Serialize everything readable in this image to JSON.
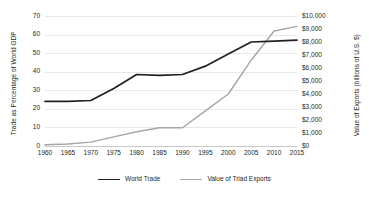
{
  "chart_data": {
    "type": "line",
    "title": "",
    "xlabel": "",
    "ylabel": "Trade as Percentage of World GDP",
    "y2label": "Value of Exports (billions of U.S. $)",
    "grid": true,
    "legend_position": "bottom",
    "x": [
      1960,
      1965,
      1970,
      1975,
      1980,
      1985,
      1990,
      1995,
      2000,
      2005,
      2010,
      2015
    ],
    "xticklabels": [
      "1960",
      "1965",
      "1970",
      "1975",
      "1980",
      "1985",
      "1990",
      "1995",
      "2000",
      "2005",
      "2010",
      "2015"
    ],
    "xlim": [
      1960,
      2015
    ],
    "ylim": [
      0,
      70
    ],
    "yticks": [
      0,
      10,
      20,
      30,
      40,
      50,
      60,
      70
    ],
    "yticklabels": [
      "0",
      "10",
      "20",
      "30",
      "40",
      "50",
      "60",
      "70"
    ],
    "y2lim": [
      0,
      10000
    ],
    "y2ticks": [
      0,
      1000,
      2000,
      3000,
      4000,
      5000,
      6000,
      7000,
      8000,
      9000,
      10000
    ],
    "y2ticklabels": [
      "$0",
      "$1,000",
      "$2,000",
      "$3,000",
      "$4,000",
      "$5,000",
      "$6,000",
      "$7,000",
      "$8,000",
      "$9,000",
      "$10,000"
    ],
    "series": [
      {
        "name": "World Trade",
        "axis": "left",
        "color": "#231f20",
        "values": [
          24,
          24,
          24.5,
          31,
          38.5,
          38,
          38.5,
          43,
          49.5,
          56,
          56.5,
          57
        ]
      },
      {
        "name": "Value of Triad Exports",
        "axis": "right",
        "color": "#a6a6a6",
        "values": [
          100,
          150,
          300,
          700,
          1100,
          1400,
          1400,
          2700,
          4000,
          6600,
          8850,
          9200
        ]
      }
    ]
  },
  "legend": {
    "items": [
      {
        "label": "World Trade",
        "swatch": "line-swatch-dark"
      },
      {
        "label": "Value of Triad Exports",
        "swatch": "line-swatch-gray"
      }
    ]
  }
}
